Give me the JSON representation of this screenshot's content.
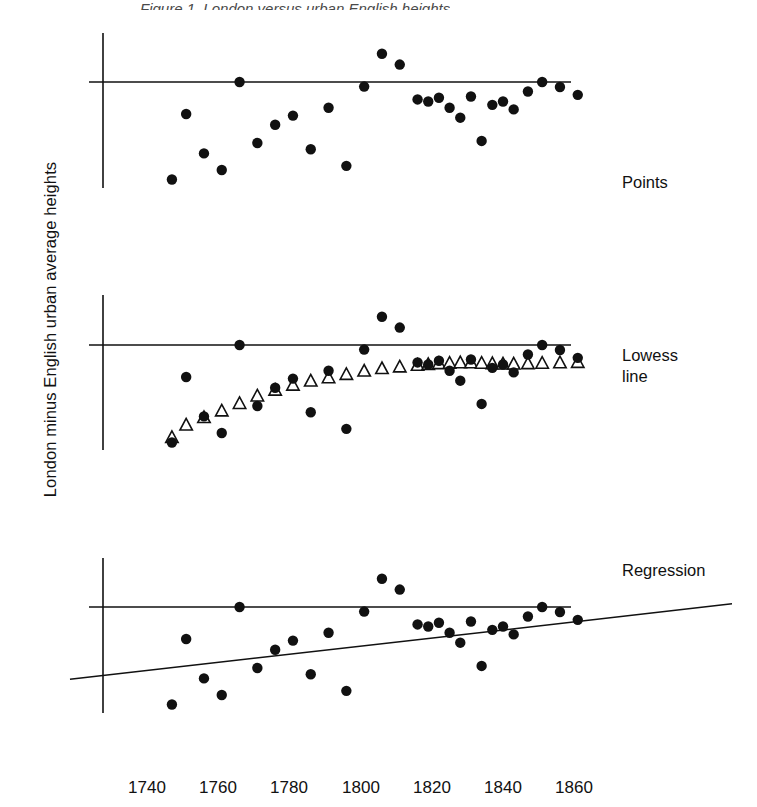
{
  "figure": {
    "ylabel": "London minus English urban average heights",
    "caption_fragment": "Figure 1. London versus urban English heights",
    "background": "#ffffff",
    "ink": "#111111"
  },
  "axis": {
    "x_ticks": [
      "1740",
      "1760",
      "1780",
      "1800",
      "1820",
      "1840",
      "1860"
    ],
    "x_tick_values": [
      1740,
      1760,
      1780,
      1800,
      1820,
      1840,
      1860
    ],
    "x_range": [
      1735,
      1870
    ],
    "zero_line_label": "0"
  },
  "panels": [
    {
      "label": "Points",
      "overlay": "none"
    },
    {
      "label": "Lowess\nline",
      "overlay": "lowess"
    },
    {
      "label": "Regression",
      "overlay": "regression"
    }
  ],
  "chart_data": {
    "type": "scatter",
    "title": "",
    "xlabel": "",
    "ylabel": "London minus English urban average heights",
    "xlim": [
      1735,
      1870
    ],
    "ylim": [
      -2.6,
      1.0
    ],
    "grid": false,
    "legend": "none",
    "panel_layout": "three stacked panels sharing one x axis",
    "note": "Each panel plots the same scatter series; panel 2 adds a lowess smooth drawn as open triangles, panel 3 adds a straight least-squares regression line.",
    "series": [
      {
        "name": "London minus English urban average heights",
        "marker": "filled-circle",
        "x": [
          1747,
          1751,
          1756,
          1761,
          1766,
          1771,
          1776,
          1781,
          1786,
          1791,
          1796,
          1801,
          1806,
          1811,
          1816,
          1819,
          1822,
          1825,
          1828,
          1831,
          1834,
          1837,
          1840,
          1843,
          1847,
          1851,
          1856,
          1861
        ],
        "y": [
          -2.35,
          -0.77,
          -1.72,
          -2.12,
          0.0,
          -1.47,
          -1.03,
          -0.81,
          -1.62,
          -0.62,
          -2.02,
          -0.11,
          0.68,
          0.42,
          -0.42,
          -0.47,
          -0.38,
          -0.62,
          -0.86,
          -0.35,
          -1.42,
          -0.55,
          -0.47,
          -0.66,
          -0.23,
          0.0,
          -0.12,
          -0.31
        ]
      },
      {
        "name": "Lowess smooth",
        "marker": "open-triangle",
        "x": [
          1747,
          1751,
          1756,
          1761,
          1766,
          1771,
          1776,
          1781,
          1786,
          1791,
          1796,
          1801,
          1806,
          1811,
          1816,
          1819,
          1822,
          1825,
          1828,
          1831,
          1834,
          1837,
          1840,
          1843,
          1847,
          1851,
          1856,
          1861
        ],
        "y": [
          -2.22,
          -1.92,
          -1.74,
          -1.58,
          -1.4,
          -1.22,
          -1.08,
          -0.96,
          -0.86,
          -0.78,
          -0.7,
          -0.62,
          -0.56,
          -0.52,
          -0.48,
          -0.46,
          -0.44,
          -0.43,
          -0.42,
          -0.42,
          -0.43,
          -0.44,
          -0.45,
          -0.45,
          -0.44,
          -0.43,
          -0.42,
          -0.41
        ]
      },
      {
        "name": "Regression line",
        "marker": "line",
        "x": [
          1735,
          1870
        ],
        "y": [
          -1.58,
          -0.26
        ]
      }
    ],
    "reference_line": {
      "orientation": "horizontal",
      "value": 0
    }
  }
}
